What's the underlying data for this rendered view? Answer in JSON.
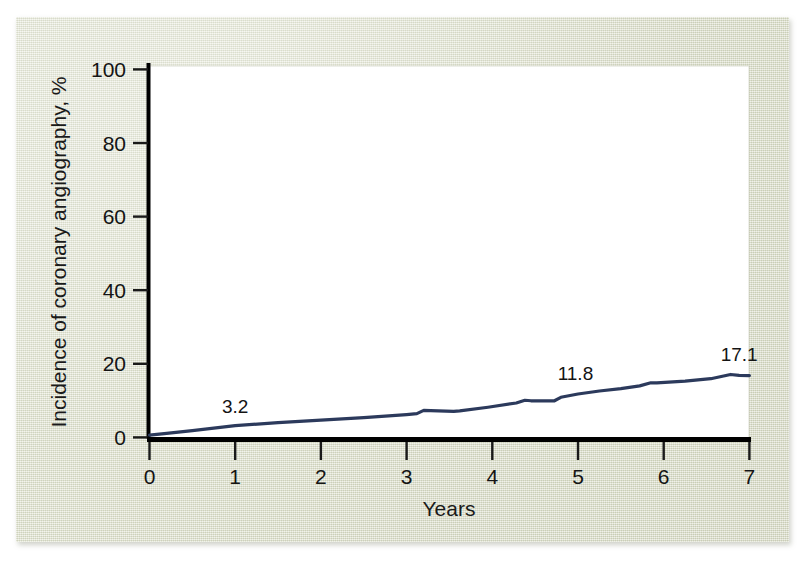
{
  "figure": {
    "background_color": "#dfe2ce",
    "plot_background_color": "#ffffff",
    "line_color": "#2c3a5c",
    "axis_color": "#000000"
  },
  "chart_data": {
    "type": "line",
    "title": "",
    "subtitle": "",
    "xlabel": "Years",
    "ylabel": "Incidence of coronary angiography, %",
    "xlim": [
      0,
      7
    ],
    "ylim": [
      0,
      100
    ],
    "xticks": [
      "0",
      "1",
      "2",
      "3",
      "4",
      "5",
      "6",
      "7"
    ],
    "yticks": [
      "0",
      "20",
      "40",
      "60",
      "80",
      "100"
    ],
    "grid": false,
    "legend": null,
    "legend_position": "none",
    "series": [
      {
        "name": "Cumulative incidence of coronary angiography",
        "x": [
          0.0,
          0.2,
          0.5,
          1.0,
          1.5,
          2.0,
          2.5,
          3.0,
          3.12,
          3.2,
          3.28,
          3.55,
          3.62,
          3.95,
          4.28,
          4.38,
          4.45,
          4.72,
          4.8,
          5.0,
          5.25,
          5.5,
          5.72,
          5.85,
          5.92,
          6.25,
          6.55,
          6.78,
          6.88,
          7.0
        ],
        "y": [
          0.6,
          1.1,
          1.85,
          3.2,
          4.0,
          4.7,
          5.4,
          6.2,
          6.45,
          7.35,
          7.3,
          7.05,
          7.2,
          8.2,
          9.35,
          10.1,
          9.95,
          9.9,
          10.9,
          11.8,
          12.6,
          13.25,
          14.0,
          14.85,
          14.8,
          15.3,
          15.95,
          17.1,
          16.85,
          16.8
        ]
      }
    ],
    "annotations": [
      {
        "text": "3.2",
        "x": 1.0,
        "y": 3.2,
        "label_x": 1.0,
        "label_y": 6.7
      },
      {
        "text": "11.8",
        "x": 5.0,
        "y": 11.8,
        "label_x": 4.97,
        "label_y": 15.6
      },
      {
        "text": "17.1",
        "x": 6.9,
        "y": 17.1,
        "label_x": 6.88,
        "label_y": 20.8
      }
    ]
  }
}
